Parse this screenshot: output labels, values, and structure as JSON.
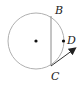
{
  "diagram": {
    "type": "geometry",
    "circle": {
      "cx": 36,
      "cy": 41,
      "r": 28,
      "stroke": "#b0b0b0"
    },
    "center_point": {
      "x": 36,
      "y": 41
    },
    "chord": {
      "from": "B",
      "to": "C",
      "x1": 51,
      "y1": 16,
      "x2": 51,
      "y2": 66,
      "stroke": "#8a8a8a"
    },
    "points": [
      {
        "label": "B",
        "x": 51,
        "y": 16
      },
      {
        "label": "C",
        "x": 51,
        "y": 66
      },
      {
        "label": "D",
        "x": 63,
        "y": 41
      }
    ],
    "ray": {
      "from": "C",
      "x1": 51,
      "y1": 66,
      "x2": 76,
      "y2": 48,
      "stroke": "#333333"
    },
    "labels": {
      "B": "B",
      "C": "C",
      "D": "D"
    }
  }
}
